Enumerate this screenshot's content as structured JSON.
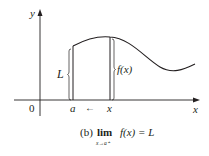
{
  "figure": {
    "axis_labels": {
      "x": "x",
      "y": "y",
      "origin": "0"
    },
    "point_labels": {
      "a": "a",
      "x": "x",
      "arrow": "←"
    },
    "brace_labels": {
      "L": "L",
      "fx": "f(x)"
    },
    "caption": {
      "prefix": "(b)",
      "lim": "lim",
      "sub": "x→a⁺",
      "expr": "f(x) = L"
    },
    "colors": {
      "ink": "#231f20",
      "background": "#ffffff"
    }
  }
}
